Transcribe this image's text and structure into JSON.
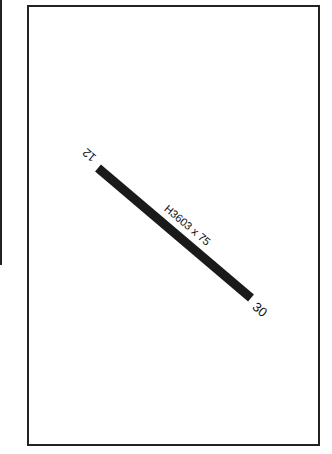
{
  "diagram": {
    "type": "airport-runway-diagram",
    "runway": {
      "label": "H3603 x 75",
      "end_a": "12",
      "end_b": "30",
      "color": "#1a1a1a"
    },
    "frame_color": "#222222",
    "background": "#ffffff"
  }
}
